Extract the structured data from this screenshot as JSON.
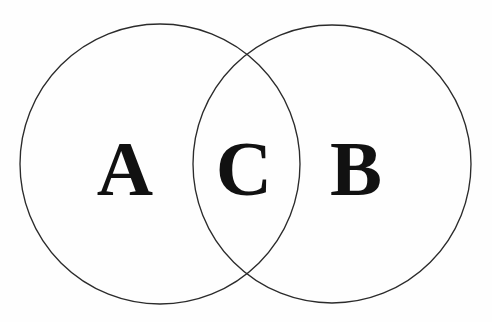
{
  "figure": {
    "background_color": "#fefefe",
    "stroke_color": "#2b2b2b",
    "label_color": "#111111",
    "width": 492,
    "height": 322
  },
  "diagram": {
    "type": "venn",
    "set_count": 2,
    "circles": [
      {
        "id": "circle-left",
        "label": "A",
        "cx": 160,
        "cy": 164,
        "r": 140,
        "fill": "none",
        "stroke": "#2b2b2b"
      },
      {
        "id": "circle-right",
        "label": "B",
        "cx": 332,
        "cy": 164,
        "r": 139,
        "fill": "none",
        "stroke": "#2b2b2b"
      }
    ],
    "regions": [
      {
        "id": "region-a",
        "label": "A",
        "description": "left-only region",
        "label_x": 125,
        "label_y": 195
      },
      {
        "id": "region-c",
        "label": "C",
        "description": "intersection region",
        "label_x": 244,
        "label_y": 195
      },
      {
        "id": "region-b",
        "label": "B",
        "description": "right-only region",
        "label_x": 356,
        "label_y": 195
      }
    ],
    "intersection_points": [
      {
        "x": 246,
        "y": 62
      },
      {
        "x": 246,
        "y": 277
      }
    ]
  },
  "chart_data": {
    "type": "diagram",
    "subtype": "venn",
    "title": "",
    "xlabel": "",
    "ylabel": "",
    "categories": [
      "A",
      "C",
      "B"
    ],
    "series": [
      {
        "name": "regions",
        "items": [
          {
            "label": "A",
            "meaning": "set A only"
          },
          {
            "label": "C",
            "meaning": "A intersect B"
          },
          {
            "label": "B",
            "meaning": "set B only"
          }
        ]
      }
    ],
    "legend": []
  }
}
